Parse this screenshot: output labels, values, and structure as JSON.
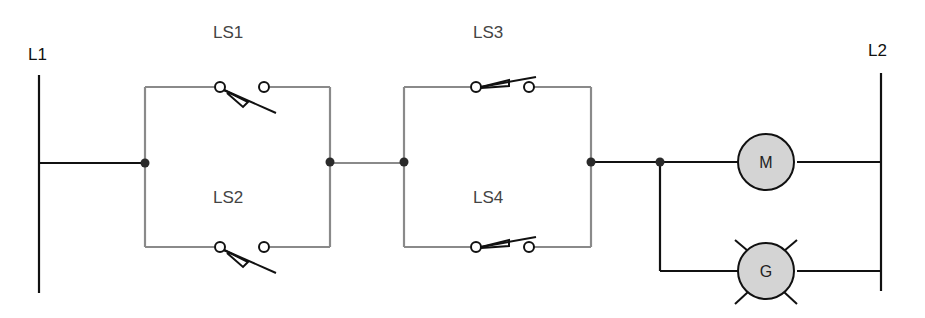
{
  "diagram": {
    "type": "ladder-logic",
    "rails": {
      "left": {
        "label": "L1"
      },
      "right": {
        "label": "L2"
      }
    },
    "switches": [
      {
        "id": "LS1",
        "label": "LS1",
        "type": "limit-switch-normally-open-held-closed"
      },
      {
        "id": "LS2",
        "label": "LS2",
        "type": "limit-switch-normally-open-held-closed"
      },
      {
        "id": "LS3",
        "label": "LS3",
        "type": "limit-switch-normally-closed"
      },
      {
        "id": "LS4",
        "label": "LS4",
        "type": "limit-switch-normally-closed"
      }
    ],
    "loads": [
      {
        "id": "M",
        "label": "M",
        "type": "motor"
      },
      {
        "id": "G",
        "label": "G",
        "type": "pilot-lamp-green"
      }
    ],
    "topology": "L1 → (LS1 ∥ LS2) → (LS3 ∥ LS4) → (M ∥ G) → L2",
    "colors": {
      "rail": "#111111",
      "branch_wire": "#8a8a8a",
      "load_fill": "#d4d4d4",
      "junction": "#2a2a2a"
    }
  }
}
